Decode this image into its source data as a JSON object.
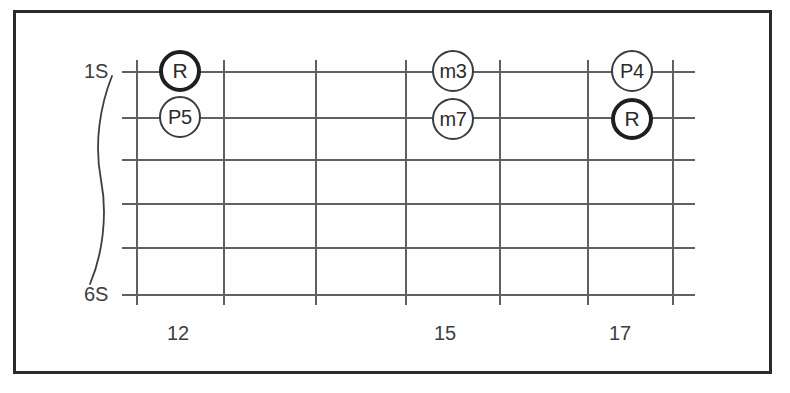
{
  "diagram": {
    "kind": "guitar-fretboard-interval-chart",
    "background_color": "#fefefe",
    "frame_color": "#2b2b2b",
    "line_color": "#5e6163",
    "text_color": "#3b3e40",
    "root_marker_color": "#1d1f20"
  },
  "string_labels": {
    "top": "1S",
    "bottom": "6S"
  },
  "fret_numbers": [
    {
      "label": "12",
      "x": 178
    },
    {
      "label": "15",
      "x": 445
    },
    {
      "label": "17",
      "x": 620
    }
  ],
  "strings": [
    {
      "index": 1,
      "y": 71
    },
    {
      "index": 2,
      "y": 117
    },
    {
      "index": 3,
      "y": 159
    },
    {
      "index": 4,
      "y": 203
    },
    {
      "index": 5,
      "y": 247
    },
    {
      "index": 6,
      "y": 294
    }
  ],
  "frets": [
    {
      "index": 1,
      "x": 136
    },
    {
      "index": 2,
      "x": 223
    },
    {
      "index": 3,
      "x": 315
    },
    {
      "index": 4,
      "x": 405
    },
    {
      "index": 5,
      "x": 499
    },
    {
      "index": 6,
      "x": 587
    },
    {
      "index": 7,
      "x": 672
    }
  ],
  "grid_extent": {
    "left": 122,
    "right": 695,
    "top": 60,
    "bottom": 305
  },
  "markers": [
    {
      "label": "R",
      "x": 180,
      "y": 71,
      "emphasis": "root",
      "string": 1,
      "size": 42
    },
    {
      "label": "P5",
      "x": 180,
      "y": 117,
      "emphasis": "interval",
      "string": 2,
      "size": 42
    },
    {
      "label": "m3",
      "x": 453,
      "y": 71,
      "emphasis": "interval",
      "string": 1,
      "size": 42
    },
    {
      "label": "m7",
      "x": 453,
      "y": 119,
      "emphasis": "interval",
      "string": 2,
      "size": 42
    },
    {
      "label": "P4",
      "x": 632,
      "y": 71,
      "emphasis": "interval",
      "string": 1,
      "size": 42
    },
    {
      "label": "R",
      "x": 632,
      "y": 119,
      "emphasis": "root",
      "string": 2,
      "size": 42
    }
  ]
}
